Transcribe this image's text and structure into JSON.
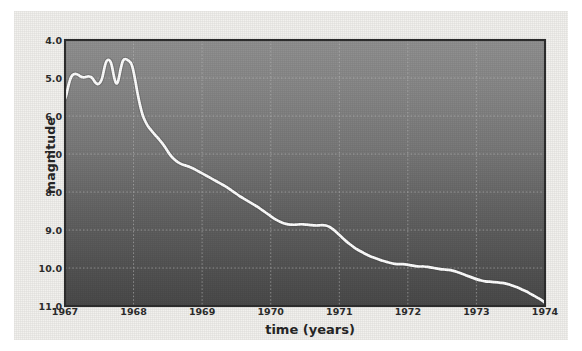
{
  "figure": {
    "kind": "scanned-light-curve-figure",
    "panel_color": "#f2f1ee",
    "plot_bg_top_color": "#8e8e8e",
    "plot_bg_bottom_color": "#4a4a4a",
    "curve_color": "#ffffff",
    "grid_color": "#b9b9b9",
    "frame_color": "#2e2e2e",
    "text_color": "#2b2b2b"
  },
  "axes": {
    "y_title": "magnitude",
    "x_title": "time (years)",
    "y_ticks": [
      "4.0",
      "5.0",
      "6.0",
      "7.0",
      "8.0",
      "9.0",
      "10.0",
      "11.0"
    ],
    "x_ticks": [
      "1967",
      "1968",
      "1969",
      "1970",
      "1971",
      "1972",
      "1973",
      "1974"
    ]
  },
  "chart_data": {
    "type": "line",
    "title": "",
    "subtitle": "",
    "xlabel": "time (years)",
    "ylabel": "magnitude",
    "xlim": [
      1967,
      1974
    ],
    "ylim": [
      4.0,
      11.0
    ],
    "y_inverted": true,
    "grid": true,
    "legend": null,
    "legend_position": "none",
    "x_tick_values": [
      1967,
      1968,
      1969,
      1970,
      1971,
      1972,
      1973,
      1974
    ],
    "y_tick_values": [
      4.0,
      5.0,
      6.0,
      7.0,
      8.0,
      9.0,
      10.0,
      11.0
    ],
    "series": [
      {
        "name": "magnitude",
        "color": "#ffffff",
        "x": [
          1967.0,
          1967.018,
          1967.035,
          1967.05,
          1967.065,
          1967.08,
          1967.095,
          1967.112,
          1967.13,
          1967.15,
          1967.172,
          1967.195,
          1967.218,
          1967.24,
          1967.262,
          1967.285,
          1967.308,
          1967.33,
          1967.352,
          1967.372,
          1967.39,
          1967.405,
          1967.42,
          1967.435,
          1967.45,
          1967.465,
          1967.48,
          1967.495,
          1967.512,
          1967.53,
          1967.548,
          1967.565,
          1967.582,
          1967.6,
          1967.618,
          1967.635,
          1967.652,
          1967.67,
          1967.688,
          1967.705,
          1967.722,
          1967.74,
          1967.758,
          1967.775,
          1967.792,
          1967.81,
          1967.828,
          1967.845,
          1967.862,
          1967.88,
          1967.898,
          1967.915,
          1967.932,
          1967.95,
          1967.968,
          1967.985,
          1968.005,
          1968.03,
          1968.06,
          1968.095,
          1968.13,
          1968.165,
          1968.2,
          1968.24,
          1968.285,
          1968.33,
          1968.375,
          1968.42,
          1968.47,
          1968.52,
          1968.57,
          1968.62,
          1968.67,
          1968.72,
          1968.77,
          1968.82,
          1968.87,
          1968.92,
          1968.97,
          1969.02,
          1969.07,
          1969.12,
          1969.17,
          1969.22,
          1969.27,
          1969.32,
          1969.375,
          1969.43,
          1969.485,
          1969.54,
          1969.595,
          1969.65,
          1969.705,
          1969.76,
          1969.815,
          1969.87,
          1969.925,
          1969.98,
          1970.035,
          1970.09,
          1970.145,
          1970.2,
          1970.255,
          1970.31,
          1970.365,
          1970.42,
          1970.475,
          1970.53,
          1970.585,
          1970.64,
          1970.695,
          1970.75,
          1970.805,
          1970.86,
          1970.915,
          1970.97,
          1971.03,
          1971.09,
          1971.15,
          1971.21,
          1971.27,
          1971.33,
          1971.39,
          1971.45,
          1971.51,
          1971.57,
          1971.63,
          1971.69,
          1971.75,
          1971.81,
          1971.87,
          1971.93,
          1971.99,
          1972.05,
          1972.11,
          1972.17,
          1972.23,
          1972.29,
          1972.35,
          1972.41,
          1972.47,
          1972.53,
          1972.59,
          1972.65,
          1972.71,
          1972.77,
          1972.83,
          1972.89,
          1972.95,
          1973.01,
          1973.07,
          1973.13,
          1973.19,
          1973.25,
          1973.31,
          1973.37,
          1973.43,
          1973.49,
          1973.55,
          1973.61,
          1973.67,
          1973.73,
          1973.79,
          1973.85,
          1973.91,
          1973.97,
          1974.0
        ],
        "y": [
          5.55,
          5.45,
          5.32,
          5.2,
          5.1,
          5.02,
          4.96,
          4.92,
          4.9,
          4.89,
          4.9,
          4.92,
          4.95,
          4.97,
          4.98,
          4.98,
          4.97,
          4.96,
          4.96,
          4.97,
          4.99,
          5.02,
          5.06,
          5.1,
          5.13,
          5.15,
          5.16,
          5.15,
          5.12,
          5.06,
          4.96,
          4.82,
          4.68,
          4.58,
          4.53,
          4.52,
          4.54,
          4.6,
          4.72,
          4.88,
          5.02,
          5.12,
          5.14,
          5.08,
          4.94,
          4.78,
          4.64,
          4.55,
          4.51,
          4.5,
          4.51,
          4.53,
          4.55,
          4.58,
          4.63,
          4.72,
          4.88,
          5.12,
          5.42,
          5.72,
          5.96,
          6.12,
          6.24,
          6.34,
          6.44,
          6.53,
          6.62,
          6.72,
          6.85,
          6.99,
          7.1,
          7.18,
          7.24,
          7.28,
          7.31,
          7.34,
          7.38,
          7.43,
          7.48,
          7.53,
          7.58,
          7.63,
          7.68,
          7.73,
          7.78,
          7.83,
          7.89,
          7.96,
          8.03,
          8.1,
          8.16,
          8.22,
          8.28,
          8.34,
          8.4,
          8.47,
          8.54,
          8.61,
          8.68,
          8.74,
          8.79,
          8.83,
          8.85,
          8.86,
          8.86,
          8.85,
          8.85,
          8.86,
          8.87,
          8.88,
          8.88,
          8.87,
          8.88,
          8.92,
          8.99,
          9.08,
          9.18,
          9.28,
          9.37,
          9.45,
          9.52,
          9.58,
          9.64,
          9.69,
          9.73,
          9.77,
          9.81,
          9.84,
          9.87,
          9.89,
          9.9,
          9.9,
          9.91,
          9.93,
          9.95,
          9.96,
          9.96,
          9.97,
          9.99,
          10.01,
          10.03,
          10.04,
          10.05,
          10.07,
          10.1,
          10.14,
          10.18,
          10.22,
          10.26,
          10.3,
          10.33,
          10.35,
          10.36,
          10.37,
          10.38,
          10.39,
          10.41,
          10.44,
          10.48,
          10.52,
          10.57,
          10.62,
          10.68,
          10.74,
          10.8,
          10.87,
          10.92
        ]
      }
    ]
  }
}
